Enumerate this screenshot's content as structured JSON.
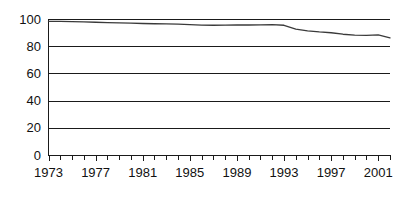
{
  "chart_data": {
    "type": "line",
    "title": "",
    "subtitle": "",
    "xlabel": "",
    "ylabel": "",
    "xlim": [
      1973,
      2002
    ],
    "ylim": [
      0,
      100
    ],
    "yticks": [
      0,
      20,
      40,
      60,
      80,
      100
    ],
    "ytick_labels": [
      "0",
      "20",
      "40",
      "60",
      "80",
      "100"
    ],
    "xticks": [
      1973,
      1977,
      1981,
      1985,
      1989,
      1993,
      1997,
      2001
    ],
    "xtick_labels": [
      "1973",
      "1977",
      "1981",
      "1985",
      "1989",
      "1993",
      "1997",
      "2001"
    ],
    "minor_xticks_every": 1,
    "grid": "horizontal",
    "legend": "none",
    "annotations": [],
    "series": [
      {
        "name": "series-1",
        "color": "#3a3a3a",
        "x": [
          1973,
          1974,
          1975,
          1976,
          1977,
          1978,
          1979,
          1980,
          1981,
          1982,
          1983,
          1984,
          1985,
          1986,
          1987,
          1988,
          1989,
          1990,
          1991,
          1992,
          1993,
          1994,
          1995,
          1996,
          1997,
          1998,
          1999,
          2000,
          2001,
          2002
        ],
        "values": [
          98.3,
          98.2,
          98.1,
          97.9,
          97.6,
          97.4,
          97.2,
          97.0,
          96.7,
          96.5,
          96.4,
          96.3,
          95.9,
          95.5,
          95.4,
          95.5,
          95.6,
          95.6,
          95.7,
          95.9,
          95.4,
          92.6,
          91.3,
          90.5,
          89.9,
          88.8,
          88.1,
          87.9,
          88.4,
          86.2
        ]
      }
    ]
  },
  "axis_colors": {
    "grid": "#1a1a1a",
    "axis": "#1a1a1a",
    "tick_text": "#111111",
    "line": "#3a3a3a",
    "background": "#ffffff"
  }
}
